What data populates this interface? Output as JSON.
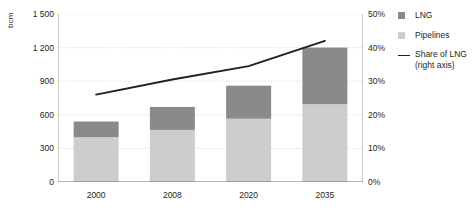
{
  "chart_data": {
    "type": "bar",
    "title": "",
    "subtitle": "",
    "xlabel": "",
    "ylabel": "bcm",
    "ylabel_right": "",
    "categories": [
      "2000",
      "2008",
      "2020",
      "2035"
    ],
    "ylim": [
      0,
      1500
    ],
    "ylim_right": [
      0,
      50
    ],
    "yticks": [
      "0",
      "300",
      "600",
      "900",
      "1 200",
      "1 500"
    ],
    "ytick_values": [
      0,
      300,
      600,
      900,
      1200,
      1500
    ],
    "yticks_right": [
      "0%",
      "10%",
      "20%",
      "30%",
      "40%",
      "50%"
    ],
    "ytick_values_right": [
      0,
      10,
      20,
      30,
      40,
      50
    ],
    "grid": true,
    "legend_position": "right",
    "stacked": true,
    "series": [
      {
        "name": "Pipelines",
        "type": "bar",
        "axis": "left",
        "color": "#cdcdcd",
        "values": [
          400,
          465,
          565,
          695
        ]
      },
      {
        "name": "LNG",
        "type": "bar",
        "axis": "left",
        "color": "#8a8a8a",
        "values": [
          140,
          205,
          295,
          505
        ]
      },
      {
        "name": "Share of LNG (right axis)",
        "type": "line",
        "axis": "right",
        "color": "#231f20",
        "values": [
          26,
          30.5,
          34.5,
          42
        ]
      }
    ],
    "totals": [
      540,
      670,
      860,
      1200
    ]
  },
  "legend": {
    "items": [
      {
        "label": "LNG",
        "sublabel": "",
        "marker": "square",
        "color": "#8a8a8a"
      },
      {
        "label": "Pipelines",
        "sublabel": "",
        "marker": "square",
        "color": "#cdcdcd"
      },
      {
        "label": "Share of LNG",
        "sublabel": "(right axis)",
        "marker": "line",
        "color": "#231f20"
      }
    ]
  },
  "colors": {
    "lng": "#8a8a8a",
    "pipelines": "#cdcdcd",
    "line": "#231f20",
    "axis": "#9a9a9a",
    "grid": "#cfcfcf",
    "text": "#231f20",
    "background": "#ffffff"
  }
}
